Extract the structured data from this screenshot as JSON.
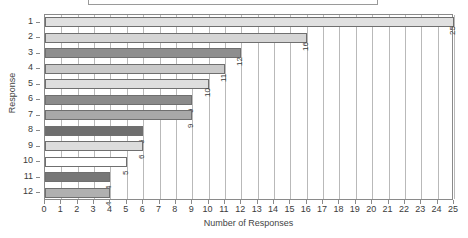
{
  "chart_data": {
    "type": "bar",
    "orientation": "horizontal",
    "title": "",
    "xlabel": "Number of Responses",
    "ylabel": "Response",
    "categories": [
      "1",
      "2",
      "3",
      "4",
      "5",
      "6",
      "7",
      "8",
      "9",
      "10",
      "11",
      "12"
    ],
    "values": [
      25,
      16,
      12,
      11,
      10,
      9,
      9,
      6,
      6,
      5,
      4,
      4
    ],
    "bar_labels": [
      "25",
      "16",
      "12",
      "11",
      "10",
      "9",
      "9",
      "6",
      "6",
      "5",
      "4",
      "4"
    ],
    "bar_colors": [
      "#e0e0e0",
      "#d5d5d5",
      "#8e8e8e",
      "#c9c9c9",
      "#dedede",
      "#8b8b8b",
      "#a8a8a8",
      "#6e6e6e",
      "#dcdcdc",
      "#ffffff",
      "#777777",
      "#b0b0b0"
    ],
    "xlim": [
      0,
      25
    ],
    "xticks": [
      "0",
      "1",
      "2",
      "3",
      "4",
      "5",
      "6",
      "7",
      "8",
      "9",
      "10",
      "11",
      "12",
      "13",
      "14",
      "15",
      "16",
      "17",
      "18",
      "19",
      "20",
      "21",
      "22",
      "23",
      "24",
      "25"
    ],
    "grid": true,
    "grid_axis": "x",
    "legend": "",
    "bar_edge_color": "#6f6f6f",
    "axis_color": "#8a8a8a",
    "grid_color": "#b9b9b9",
    "background": "#ffffff"
  },
  "titlebox": {
    "text": ""
  }
}
